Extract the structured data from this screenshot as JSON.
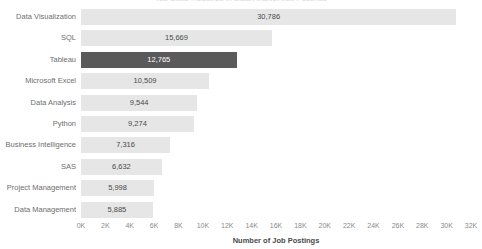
{
  "chart_data": {
    "type": "bar",
    "orientation": "horizontal",
    "title": "Top Skills Required in Data Analyst Job Postings",
    "xlabel": "Number of Job Postings",
    "ylabel": "",
    "xlim": [
      0,
      32000
    ],
    "xticks": [
      0,
      2000,
      4000,
      6000,
      8000,
      10000,
      12000,
      14000,
      16000,
      18000,
      20000,
      22000,
      24000,
      26000,
      28000,
      30000,
      32000
    ],
    "xtick_labels": [
      "0K",
      "2K",
      "4K",
      "6K",
      "8K",
      "10K",
      "12K",
      "14K",
      "16K",
      "18K",
      "20K",
      "22K",
      "24K",
      "26K",
      "28K",
      "30K",
      "32K"
    ],
    "grid": false,
    "legend": null,
    "categories": [
      "Data Visualization",
      "SQL",
      "Tableau",
      "Microsoft Excel",
      "Data Analysis",
      "Python",
      "Business Intelligence",
      "SAS",
      "Project Management",
      "Data Management"
    ],
    "values": [
      30786,
      15669,
      12765,
      10509,
      9544,
      9274,
      7316,
      6632,
      5998,
      5885
    ],
    "value_labels": [
      "30,786",
      "15,669",
      "12,765",
      "10,509",
      "9,544",
      "9,274",
      "7,316",
      "6,632",
      "5,998",
      "5,885"
    ],
    "highlighted_category": "Tableau",
    "colors": {
      "bar": "#e6e6e6",
      "bar_highlight": "#5a5a5a",
      "value_label": "#4a4a4a",
      "value_label_highlight": "#ffffff",
      "category_label": "#6e6e6e",
      "tick_label": "#8a8a8a",
      "axis_title": "#4a4a4a",
      "background": "#ffffff"
    }
  }
}
